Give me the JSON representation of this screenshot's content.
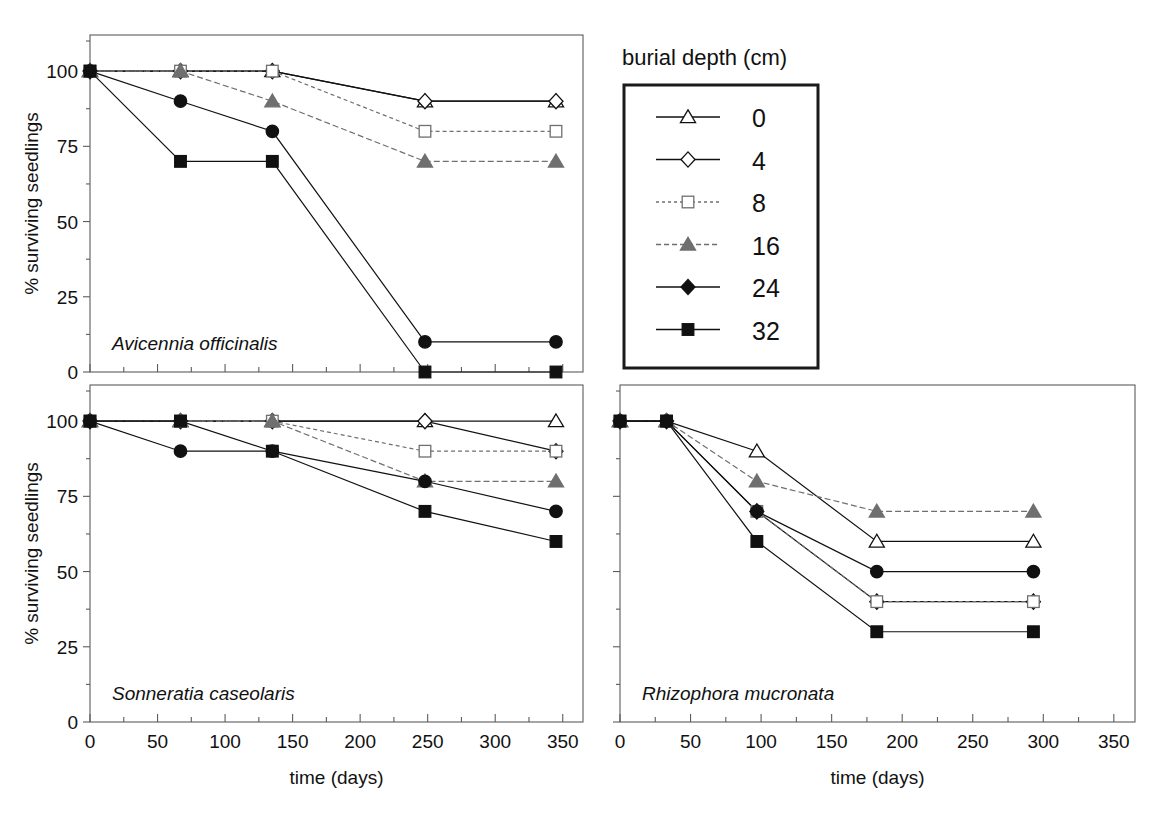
{
  "legend": {
    "title": "burial depth (cm)",
    "entries": [
      {
        "label": "0",
        "marker": "triangle-open",
        "color": "#111111",
        "fill": "#ffffff",
        "dash": "none"
      },
      {
        "label": "4",
        "marker": "diamond-open",
        "color": "#111111",
        "fill": "#ffffff",
        "dash": "none"
      },
      {
        "label": "8",
        "marker": "square-open",
        "color": "#6f6f6f",
        "fill": "#ffffff",
        "dash": "3,3"
      },
      {
        "label": "16",
        "marker": "triangle-filled",
        "color": "#6f6f6f",
        "fill": "#6f6f6f",
        "dash": "5,3"
      },
      {
        "label": "24",
        "marker": "diamond-filled",
        "color": "#111111",
        "fill": "#111111",
        "dash": "none"
      },
      {
        "label": "32",
        "marker": "square-filled",
        "color": "#111111",
        "fill": "#111111",
        "dash": "none"
      }
    ]
  },
  "axes": {
    "ylabel": "% surviving seedlings",
    "xlabel": "time (days)",
    "yticks": [
      0,
      25,
      50,
      75,
      100
    ],
    "yminor": [
      12.5,
      37.5,
      62.5,
      87.5,
      110
    ],
    "xticks": [
      0,
      50,
      100,
      150,
      200,
      250,
      300,
      350
    ],
    "xlim": [
      0,
      365
    ],
    "ylim": [
      0,
      112
    ]
  },
  "panels": [
    {
      "id": "panel-avicennia",
      "species": "Avicennia officinalis",
      "show_y_labels": true,
      "show_x_labels": false,
      "show_x_title": false
    },
    {
      "id": "panel-sonneratia",
      "species": "Sonneratia caseolaris",
      "show_y_labels": true,
      "show_x_labels": true,
      "show_x_title": true
    },
    {
      "id": "panel-rhizophora",
      "species": "Rhizophora mucronata",
      "show_y_labels": false,
      "show_x_labels": true,
      "show_x_title": true
    }
  ],
  "chart_data": [
    {
      "type": "line",
      "panel": "Avicennia officinalis",
      "title": "Avicennia officinalis",
      "xlabel": "time (days)",
      "ylabel": "% surviving seedlings",
      "xlim": [
        0,
        365
      ],
      "ylim": [
        0,
        112
      ],
      "xticks": [
        0,
        50,
        100,
        150,
        200,
        250,
        300,
        350
      ],
      "yticks": [
        0,
        25,
        50,
        75,
        100
      ],
      "grid": false,
      "legend": "burial depth (cm)",
      "legend_position": "outside-right-top",
      "x": [
        0,
        67,
        135,
        248,
        345
      ],
      "series": [
        {
          "name": "0",
          "values": [
            100,
            100,
            100,
            90,
            90
          ]
        },
        {
          "name": "4",
          "values": [
            100,
            100,
            100,
            90,
            90
          ]
        },
        {
          "name": "8",
          "values": [
            100,
            100,
            100,
            80,
            80
          ]
        },
        {
          "name": "16",
          "values": [
            100,
            100,
            90,
            70,
            70
          ]
        },
        {
          "name": "24",
          "values": [
            100,
            90,
            80,
            10,
            10
          ]
        },
        {
          "name": "32",
          "values": [
            100,
            70,
            70,
            0,
            0
          ]
        }
      ]
    },
    {
      "type": "line",
      "panel": "Sonneratia caseolaris",
      "title": "Sonneratia caseolaris",
      "xlabel": "time (days)",
      "ylabel": "% surviving seedlings",
      "xlim": [
        0,
        365
      ],
      "ylim": [
        0,
        112
      ],
      "xticks": [
        0,
        50,
        100,
        150,
        200,
        250,
        300,
        350
      ],
      "yticks": [
        0,
        25,
        50,
        75,
        100
      ],
      "grid": false,
      "x": [
        0,
        67,
        135,
        248,
        345
      ],
      "series": [
        {
          "name": "0",
          "values": [
            100,
            100,
            100,
            100,
            100
          ]
        },
        {
          "name": "4",
          "values": [
            100,
            100,
            100,
            100,
            90
          ]
        },
        {
          "name": "8",
          "values": [
            100,
            100,
            100,
            90,
            90
          ]
        },
        {
          "name": "16",
          "values": [
            100,
            100,
            100,
            80,
            80
          ]
        },
        {
          "name": "24",
          "values": [
            100,
            90,
            90,
            80,
            70
          ]
        },
        {
          "name": "32",
          "values": [
            100,
            100,
            90,
            70,
            60
          ]
        }
      ]
    },
    {
      "type": "line",
      "panel": "Rhizophora mucronata",
      "title": "Rhizophora mucronata",
      "xlabel": "time (days)",
      "ylabel": "% surviving seedlings",
      "xlim": [
        0,
        365
      ],
      "ylim": [
        0,
        112
      ],
      "xticks": [
        0,
        50,
        100,
        150,
        200,
        250,
        300,
        350
      ],
      "yticks": [
        0,
        25,
        50,
        75,
        100
      ],
      "grid": false,
      "x": [
        0,
        33,
        97,
        182,
        293
      ],
      "series": [
        {
          "name": "0",
          "values": [
            100,
            100,
            90,
            60,
            60
          ]
        },
        {
          "name": "4",
          "values": [
            100,
            100,
            70,
            40,
            40
          ]
        },
        {
          "name": "8",
          "values": [
            100,
            100,
            70,
            40,
            40
          ]
        },
        {
          "name": "16",
          "values": [
            100,
            100,
            80,
            70,
            70
          ]
        },
        {
          "name": "24",
          "values": [
            100,
            100,
            70,
            50,
            50
          ]
        },
        {
          "name": "32",
          "values": [
            100,
            100,
            60,
            30,
            30
          ]
        }
      ]
    }
  ]
}
